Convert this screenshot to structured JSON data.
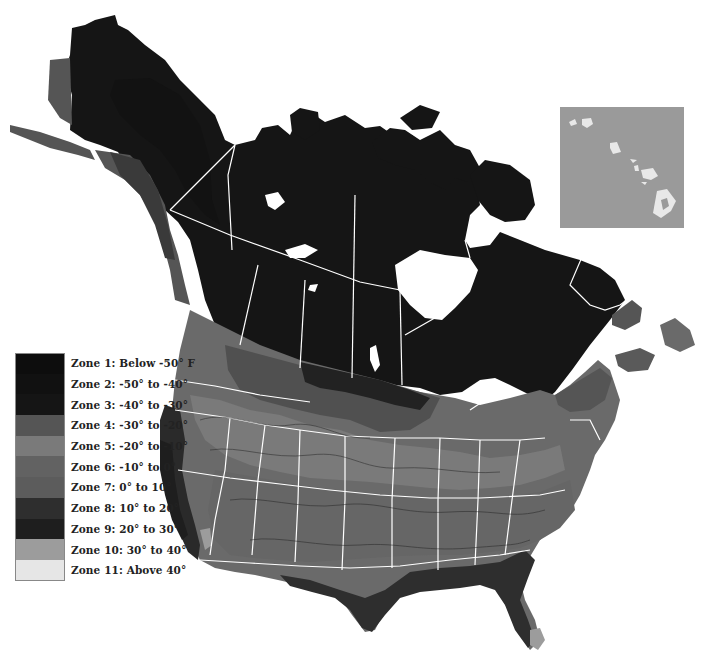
{
  "map": {
    "subject": "USDA plant hardiness zone map of North America (Alaska, Canada, contiguous US, Hawaii inset)",
    "inset": {
      "region": "Hawaii",
      "fill": "#9a9a9a",
      "island_fill": "#e8e8e8"
    },
    "boundary_color": "#ffffff",
    "water_color": "#ffffff"
  },
  "legend": {
    "items": [
      {
        "label": "Zone 1: Below -50° F",
        "color": "#0d0d0d"
      },
      {
        "label": "Zone 2: -50° to -40°",
        "color": "#111111"
      },
      {
        "label": "Zone 3: -40° to -30°",
        "color": "#151515"
      },
      {
        "label": "Zone 4: -30° to -20°",
        "color": "#555555"
      },
      {
        "label": "Zone 5: -20° to -10°",
        "color": "#7a7a7a"
      },
      {
        "label": "Zone 6: -10° to 0°",
        "color": "#626262"
      },
      {
        "label": "Zone 7: 0° to 10°",
        "color": "#5c5c5c"
      },
      {
        "label": "Zone 8: 10° to 20°",
        "color": "#2e2e2e"
      },
      {
        "label": "Zone 9: 20° to 30°",
        "color": "#1e1e1e"
      },
      {
        "label": "Zone 10: 30° to 40°",
        "color": "#9c9c9c"
      },
      {
        "label": "Zone 11: Above 40°",
        "color": "#e6e6e6"
      }
    ]
  }
}
